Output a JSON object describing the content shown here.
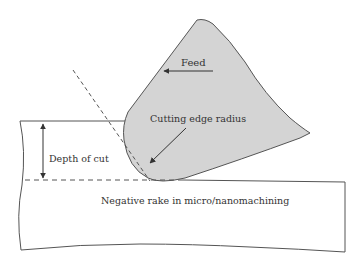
{
  "diagram": {
    "title": "Negative rake in micro/nanomachining",
    "labels": {
      "feed": "Feed",
      "cutting_edge_radius": "Cutting edge radius",
      "depth_of_cut": "Depth of cut",
      "caption": "Negative rake in micro/nanomachining"
    },
    "colors": {
      "tool_fill": "#d4d4d4",
      "stroke": "#555555",
      "text": "#333333",
      "background": "#ffffff"
    },
    "elements": [
      {
        "id": "tool",
        "type": "shape",
        "description": "Cutting tool with rounded cutting edge"
      },
      {
        "id": "workpiece",
        "type": "shape",
        "description": "Workpiece block"
      },
      {
        "id": "uncut-surface-dashed-line",
        "type": "dashed-line"
      },
      {
        "id": "rake-face-dashed-line",
        "type": "dashed-line"
      },
      {
        "id": "feed-arrow",
        "type": "arrow",
        "direction": "left"
      },
      {
        "id": "cutting-edge-radius-arrow",
        "type": "arrow",
        "direction": "down-left"
      },
      {
        "id": "depth-of-cut-arrow",
        "type": "double-arrow",
        "direction": "vertical"
      }
    ]
  }
}
